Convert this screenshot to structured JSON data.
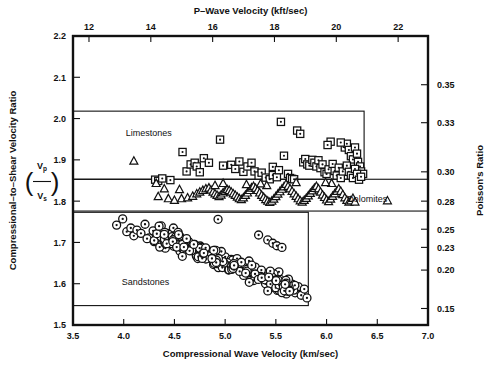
{
  "figure": {
    "background": "#ffffff",
    "ink": "#111111"
  },
  "axes": {
    "bottom": {
      "title": "Compressional Wave Velocity (km/sec)",
      "ticks": [
        "3.5",
        "4.0",
        "4.5",
        "5.0",
        "5.5",
        "6.0",
        "6.5",
        "7.0"
      ],
      "min": 3.5,
      "max": 7.0
    },
    "top": {
      "title": "P–Wave Velocity (kft/sec)",
      "ticks": [
        "12",
        "14",
        "16",
        "18",
        "20",
        "22"
      ],
      "tick_values": [
        12,
        14,
        16,
        18,
        20,
        22
      ]
    },
    "left": {
      "title": "Compressional–to–Shear Velocity Ratio",
      "symbol_num": "V",
      "symbol_num_sub": "p",
      "symbol_den": "V",
      "symbol_den_sub": "s",
      "ticks": [
        "2.2",
        "2.1",
        "2.0",
        "1.9",
        "1.8",
        "1.7",
        "1.6",
        "1.5"
      ],
      "min": 1.5,
      "max": 2.2
    },
    "right": {
      "title": "Poisson's Ratio",
      "ticks": [
        {
          "label": "0.35",
          "ratio": 2.082
        },
        {
          "label": "0.33",
          "ratio": 1.99
        },
        {
          "label": "0.30",
          "ratio": 1.871
        },
        {
          "label": "0.28",
          "ratio": 1.8
        },
        {
          "label": "0.25",
          "ratio": 1.732
        },
        {
          "label": "0.23",
          "ratio": 1.688
        },
        {
          "label": "0.20",
          "ratio": 1.633
        },
        {
          "label": "0.15",
          "ratio": 1.54
        }
      ]
    }
  },
  "groups": [
    {
      "name": "Limestones",
      "marker": "square-dot",
      "label_x": 4.02,
      "label_y": 1.965,
      "box": {
        "x0": 3.5,
        "x1": 6.37,
        "y0": 1.853,
        "y1": 2.018
      }
    },
    {
      "name": "Dolomites",
      "marker": "triangle",
      "label_x": 6.4,
      "label_y": 1.806,
      "label_anchor": "middle",
      "box": {
        "x0": 3.5,
        "x1": 7.0,
        "y0": 1.776,
        "y1": 1.853
      }
    },
    {
      "name": "Sandstones",
      "marker": "circle-dot",
      "label_x": 3.98,
      "label_y": 1.604,
      "box": {
        "x0": 3.5,
        "x1": 5.82,
        "y0": 1.547,
        "y1": 1.773
      }
    }
  ],
  "chart_data": {
    "type": "scatter",
    "title": "",
    "xlabel": "Compressional Wave Velocity (km/sec)",
    "ylabel": "Compressional-to-Shear Velocity Ratio (Vp/Vs)",
    "xlim": [
      3.5,
      7.0
    ],
    "ylim": [
      1.5,
      2.2
    ],
    "grid": false,
    "legend": "in-plot group boxes",
    "secondary_x": {
      "label": "P-Wave Velocity (kft/sec)",
      "ticks": [
        12,
        14,
        16,
        18,
        20,
        22
      ]
    },
    "secondary_y": {
      "label": "Poisson's Ratio",
      "ticks": [
        0.35,
        0.33,
        0.3,
        0.28,
        0.25,
        0.23,
        0.2,
        0.15
      ]
    },
    "series": [
      {
        "name": "Limestones",
        "marker": "square-dot",
        "n": 78,
        "points": [
          [
            4.31,
            1.852
          ],
          [
            4.34,
            1.849
          ],
          [
            4.38,
            1.855
          ],
          [
            4.46,
            1.851
          ],
          [
            4.58,
            1.919
          ],
          [
            4.62,
            1.872
          ],
          [
            4.66,
            1.889
          ],
          [
            4.7,
            1.893
          ],
          [
            4.72,
            1.884
          ],
          [
            4.75,
            1.87
          ],
          [
            4.79,
            1.904
          ],
          [
            4.84,
            1.893
          ],
          [
            4.95,
            1.949
          ],
          [
            4.98,
            1.886
          ],
          [
            5.06,
            1.888
          ],
          [
            5.1,
            1.878
          ],
          [
            5.14,
            1.896
          ],
          [
            5.18,
            1.871
          ],
          [
            5.22,
            1.884
          ],
          [
            5.26,
            1.893
          ],
          [
            5.29,
            1.872
          ],
          [
            5.33,
            1.862
          ],
          [
            5.36,
            1.869
          ],
          [
            5.4,
            1.857
          ],
          [
            5.44,
            1.853
          ],
          [
            5.47,
            1.863
          ],
          [
            5.51,
            1.858
          ],
          [
            5.55,
            1.992
          ],
          [
            5.58,
            1.91
          ],
          [
            5.62,
            1.866
          ],
          [
            5.64,
            1.856
          ],
          [
            5.66,
            1.854
          ],
          [
            5.68,
            1.853
          ],
          [
            5.71,
            1.971
          ],
          [
            5.74,
            1.963
          ],
          [
            5.77,
            1.894
          ],
          [
            5.79,
            1.902
          ],
          [
            5.81,
            1.889
          ],
          [
            5.83,
            1.886
          ],
          [
            5.86,
            1.9
          ],
          [
            5.88,
            1.893
          ],
          [
            5.9,
            1.884
          ],
          [
            5.92,
            1.899
          ],
          [
            5.94,
            1.88
          ],
          [
            5.96,
            1.889
          ],
          [
            5.98,
            1.87
          ],
          [
            6.0,
            1.866
          ],
          [
            6.02,
            1.877
          ],
          [
            6.04,
            1.944
          ],
          [
            6.06,
            1.89
          ],
          [
            6.08,
            1.873
          ],
          [
            6.1,
            1.862
          ],
          [
            6.12,
            1.881
          ],
          [
            6.14,
            1.856
          ],
          [
            6.16,
            1.872
          ],
          [
            6.18,
            1.93
          ],
          [
            6.2,
            1.939
          ],
          [
            6.22,
            1.924
          ],
          [
            6.24,
            1.909
          ],
          [
            6.26,
            1.901
          ],
          [
            6.28,
            1.93
          ],
          [
            6.3,
            1.915
          ],
          [
            6.31,
            1.895
          ],
          [
            6.33,
            1.884
          ],
          [
            6.34,
            1.872
          ],
          [
            6.36,
            1.866
          ],
          [
            6.2,
            1.886
          ],
          [
            6.22,
            1.871
          ],
          [
            6.24,
            1.862
          ],
          [
            6.26,
            1.856
          ],
          [
            6.28,
            1.878
          ],
          [
            6.3,
            1.866
          ],
          [
            6.32,
            1.852
          ],
          [
            6.34,
            1.859
          ],
          [
            6.14,
            1.942
          ],
          [
            6.01,
            1.936
          ],
          [
            5.47,
            1.883
          ],
          [
            5.53,
            1.875
          ]
        ]
      },
      {
        "name": "Dolomites",
        "marker": "triangle",
        "n": 96,
        "points": [
          [
            4.1,
            1.897
          ],
          [
            4.32,
            1.843
          ],
          [
            4.34,
            1.811
          ],
          [
            4.44,
            1.806
          ],
          [
            4.5,
            1.802
          ],
          [
            4.57,
            1.806
          ],
          [
            4.63,
            1.808
          ],
          [
            4.68,
            1.812
          ],
          [
            4.72,
            1.818
          ],
          [
            4.75,
            1.822
          ],
          [
            4.78,
            1.826
          ],
          [
            4.81,
            1.83
          ],
          [
            4.84,
            1.832
          ],
          [
            4.86,
            1.827
          ],
          [
            4.88,
            1.822
          ],
          [
            4.9,
            1.818
          ],
          [
            4.92,
            1.814
          ],
          [
            4.94,
            1.811
          ],
          [
            4.96,
            1.815
          ],
          [
            4.98,
            1.82
          ],
          [
            5.0,
            1.824
          ],
          [
            5.02,
            1.828
          ],
          [
            5.04,
            1.826
          ],
          [
            5.06,
            1.822
          ],
          [
            5.08,
            1.818
          ],
          [
            5.1,
            1.814
          ],
          [
            5.12,
            1.81
          ],
          [
            5.14,
            1.806
          ],
          [
            5.16,
            1.804
          ],
          [
            5.18,
            1.808
          ],
          [
            5.2,
            1.814
          ],
          [
            5.22,
            1.82
          ],
          [
            5.24,
            1.826
          ],
          [
            5.26,
            1.832
          ],
          [
            5.28,
            1.836
          ],
          [
            5.3,
            1.831
          ],
          [
            5.32,
            1.826
          ],
          [
            5.34,
            1.82
          ],
          [
            5.36,
            1.814
          ],
          [
            5.38,
            1.809
          ],
          [
            5.4,
            1.804
          ],
          [
            5.42,
            1.8
          ],
          [
            5.44,
            1.797
          ],
          [
            5.46,
            1.8
          ],
          [
            5.48,
            1.805
          ],
          [
            5.5,
            1.811
          ],
          [
            5.52,
            1.817
          ],
          [
            5.54,
            1.823
          ],
          [
            5.56,
            1.829
          ],
          [
            5.58,
            1.835
          ],
          [
            5.6,
            1.841
          ],
          [
            5.62,
            1.836
          ],
          [
            5.64,
            1.83
          ],
          [
            5.66,
            1.824
          ],
          [
            5.68,
            1.818
          ],
          [
            5.7,
            1.812
          ],
          [
            5.72,
            1.806
          ],
          [
            5.74,
            1.801
          ],
          [
            5.76,
            1.798
          ],
          [
            5.78,
            1.802
          ],
          [
            5.8,
            1.807
          ],
          [
            5.82,
            1.813
          ],
          [
            5.84,
            1.819
          ],
          [
            5.86,
            1.825
          ],
          [
            5.88,
            1.831
          ],
          [
            5.9,
            1.836
          ],
          [
            5.92,
            1.83
          ],
          [
            5.94,
            1.822
          ],
          [
            5.96,
            1.815
          ],
          [
            5.98,
            1.809
          ],
          [
            6.0,
            1.803
          ],
          [
            6.02,
            1.799
          ],
          [
            6.04,
            1.805
          ],
          [
            6.06,
            1.812
          ],
          [
            6.08,
            1.818
          ],
          [
            6.1,
            1.824
          ],
          [
            6.12,
            1.83
          ],
          [
            6.14,
            1.824
          ],
          [
            6.16,
            1.816
          ],
          [
            6.18,
            1.808
          ],
          [
            6.2,
            1.802
          ],
          [
            6.22,
            1.798
          ],
          [
            6.24,
            1.801
          ],
          [
            6.26,
            1.807
          ],
          [
            6.28,
            1.798
          ],
          [
            6.05,
            1.843
          ],
          [
            5.99,
            1.845
          ],
          [
            5.41,
            1.838
          ],
          [
            5.35,
            1.842
          ],
          [
            5.21,
            1.84
          ],
          [
            4.98,
            1.843
          ],
          [
            4.55,
            1.828
          ],
          [
            4.4,
            1.83
          ],
          [
            6.6,
            1.801
          ],
          [
            4.9,
            1.838
          ],
          [
            5.7,
            1.845
          ]
        ]
      },
      {
        "name": "Sandstones",
        "marker": "circle-dot",
        "n": 240,
        "points": [
          [
            3.93,
            1.742
          ],
          [
            3.99,
            1.757
          ],
          [
            4.03,
            1.726
          ],
          [
            4.07,
            1.735
          ],
          [
            4.1,
            1.716
          ],
          [
            4.13,
            1.73
          ],
          [
            4.17,
            1.722
          ],
          [
            4.21,
            1.744
          ],
          [
            4.25,
            1.711
          ],
          [
            4.29,
            1.728
          ],
          [
            4.33,
            1.718
          ],
          [
            4.37,
            1.74
          ],
          [
            4.4,
            1.704
          ],
          [
            4.43,
            1.722
          ],
          [
            4.46,
            1.713
          ],
          [
            4.49,
            1.735
          ],
          [
            4.52,
            1.698
          ],
          [
            4.55,
            1.716
          ],
          [
            4.58,
            1.707
          ],
          [
            4.61,
            1.688
          ],
          [
            4.64,
            1.702
          ],
          [
            4.67,
            1.68
          ],
          [
            4.7,
            1.695
          ],
          [
            4.73,
            1.674
          ],
          [
            4.76,
            1.689
          ],
          [
            4.79,
            1.668
          ],
          [
            4.82,
            1.683
          ],
          [
            4.85,
            1.662
          ],
          [
            4.88,
            1.677
          ],
          [
            4.91,
            1.656
          ],
          [
            4.94,
            1.671
          ],
          [
            4.97,
            1.65
          ],
          [
            5.0,
            1.665
          ],
          [
            5.03,
            1.644
          ],
          [
            5.06,
            1.659
          ],
          [
            5.09,
            1.638
          ],
          [
            5.12,
            1.653
          ],
          [
            5.15,
            1.632
          ],
          [
            5.18,
            1.647
          ],
          [
            5.21,
            1.626
          ],
          [
            5.24,
            1.641
          ],
          [
            5.27,
            1.62
          ],
          [
            5.3,
            1.635
          ],
          [
            5.33,
            1.614
          ],
          [
            5.36,
            1.629
          ],
          [
            5.39,
            1.608
          ],
          [
            5.42,
            1.623
          ],
          [
            5.45,
            1.602
          ],
          [
            5.48,
            1.617
          ],
          [
            5.51,
            1.596
          ],
          [
            5.54,
            1.611
          ],
          [
            5.57,
            1.59
          ],
          [
            5.6,
            1.605
          ],
          [
            5.63,
            1.584
          ],
          [
            5.66,
            1.599
          ],
          [
            5.69,
            1.578
          ],
          [
            5.72,
            1.593
          ],
          [
            5.75,
            1.572
          ],
          [
            5.78,
            1.587
          ],
          [
            4.93,
            1.756
          ],
          [
            5.33,
            1.718
          ],
          [
            5.42,
            1.706
          ],
          [
            5.47,
            1.698
          ],
          [
            5.51,
            1.692
          ],
          [
            5.56,
            1.688
          ],
          [
            4.36,
            1.694
          ],
          [
            4.41,
            1.686
          ],
          [
            4.3,
            1.702
          ],
          [
            4.23,
            1.709
          ]
        ],
        "note": "dense elongated negative-slope cluster, ~240 overlapping symbols"
      }
    ]
  }
}
